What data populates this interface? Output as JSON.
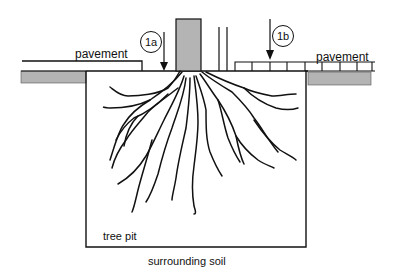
{
  "diagram": {
    "labels": {
      "pavement_left": "pavement",
      "pavement_right": "pavement",
      "tree_pit": "tree pit",
      "surrounding_soil": "surrounding soil"
    },
    "callouts": [
      {
        "id": "1a",
        "text": "1a"
      },
      {
        "id": "1b",
        "text": "1b"
      }
    ],
    "colors": {
      "line": "#111111",
      "fill_gray": "#b4b4b4",
      "background": "#ffffff"
    }
  }
}
